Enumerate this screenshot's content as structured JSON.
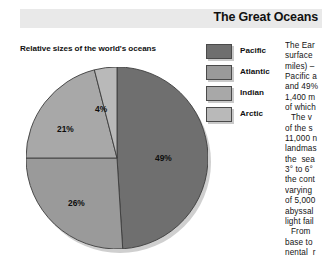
{
  "header": {
    "title": "The Great Oceans",
    "band_color": "#e9e9e9"
  },
  "figure": {
    "caption": "Relative sizes of the world's oceans"
  },
  "legend": {
    "items": [
      {
        "label": "Pacific",
        "color": "#6f6f6f"
      },
      {
        "label": "Atlantic",
        "color": "#9a9a9a"
      },
      {
        "label": "Indian",
        "color": "#a8a8a8"
      },
      {
        "label": "Arctic",
        "color": "#b9b9b9"
      }
    ]
  },
  "chart_data": {
    "type": "pie",
    "title": "Relative sizes of the world's oceans",
    "categories": [
      "Pacific",
      "Atlantic",
      "Indian",
      "Arctic"
    ],
    "values": [
      49,
      26,
      21,
      4
    ],
    "labels": [
      "49%",
      "26%",
      "21%",
      "4%"
    ],
    "colors": [
      "#6f6f6f",
      "#9a9a9a",
      "#a8a8a8",
      "#b9b9b9"
    ],
    "unit": "percent",
    "legend_position": "top-right",
    "start_angle_deg": 0,
    "direction": "clockwise",
    "grid": false
  },
  "slice_labels": {
    "pacific": "49%",
    "atlantic": "26%",
    "indian": "21%",
    "arctic": "4%"
  },
  "article": {
    "paragraph_1": "The Ear\nsurface\nmiles) –\nPacific a\nand 49%\n1,400 m\nof which",
    "paragraph_2": "The v\nof the s\n11,000 n\nlandmas\nthe  sea\n3° to 6°\nthe cont\nvarying\nof 5,000\nabyssal\nlight fail",
    "paragraph_3": "From\nbase to\nnental  r"
  }
}
